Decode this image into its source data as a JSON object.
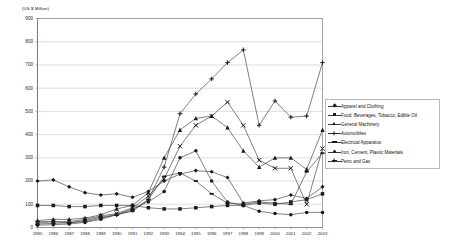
{
  "chart_data": {
    "type": "line",
    "title": "",
    "subtitle": "",
    "xlabel": "",
    "ylabel": "(US $ Million)",
    "ylim": [
      0,
      900
    ],
    "ytick_step": 100,
    "yticks": [
      "0",
      "100",
      "200",
      "300",
      "400",
      "500",
      "600",
      "700",
      "800",
      "900"
    ],
    "grid": true,
    "grid_axis": "y",
    "legend_position": "right-middle",
    "categories": [
      "1985",
      "1986",
      "1987",
      "1988",
      "1989",
      "1990",
      "1991",
      "1992",
      "1993",
      "1994",
      "1995",
      "1996",
      "1997",
      "1998",
      "1999",
      "2000",
      "2001",
      "2002",
      "2003"
    ],
    "x": [
      "1985",
      "1986",
      "1987",
      "1988",
      "1989",
      "1990",
      "1991",
      "1992",
      "1993",
      "1994",
      "1995",
      "1996",
      "1997",
      "1998",
      "1999",
      "2000",
      "2001",
      "2002",
      "2003"
    ],
    "series": [
      {
        "name": "Apparel and Clothing",
        "marker": "diamond",
        "values": [
          200,
          205,
          175,
          150,
          140,
          145,
          130,
          155,
          200,
          230,
          245,
          240,
          215,
          105,
          115,
          120,
          140,
          125,
          175
        ]
      },
      {
        "name": "Food, Beverages, Tobacco, Edible Oil",
        "marker": "square",
        "values": [
          95,
          95,
          90,
          90,
          95,
          95,
          95,
          85,
          80,
          80,
          85,
          90,
          95,
          95,
          105,
          100,
          110,
          120,
          145
        ]
      },
      {
        "name": "General Machinery",
        "marker": "triangle",
        "values": [
          30,
          35,
          35,
          40,
          55,
          80,
          95,
          150,
          300,
          420,
          470,
          480,
          430,
          330,
          260,
          300,
          300,
          250,
          420
        ]
      },
      {
        "name": "Automobiles",
        "marker": "cross",
        "values": [
          20,
          25,
          25,
          35,
          50,
          60,
          85,
          135,
          210,
          350,
          440,
          480,
          540,
          440,
          290,
          255,
          255,
          100,
          340
        ]
      },
      {
        "name": "Electrical Apparatus",
        "marker": "bar",
        "values": [
          15,
          18,
          20,
          30,
          45,
          55,
          70,
          120,
          220,
          235,
          200,
          145,
          105,
          100,
          110,
          105,
          100,
          240,
          320
        ]
      },
      {
        "name": "Iron, Cement, Plastic Materials",
        "marker": "circle",
        "values": [
          10,
          12,
          15,
          22,
          35,
          55,
          80,
          110,
          155,
          300,
          330,
          200,
          110,
          95,
          70,
          60,
          55,
          65,
          65
        ]
      },
      {
        "name": "Petro and Gas",
        "marker": "plus",
        "values": [
          25,
          25,
          20,
          25,
          40,
          55,
          75,
          120,
          260,
          490,
          575,
          640,
          710,
          765,
          440,
          545,
          475,
          480,
          710
        ]
      }
    ]
  },
  "legend": {
    "items": [
      {
        "label": "Apparel and Clothing",
        "marker": "diamond"
      },
      {
        "label": "Food, Beverages, Tobacco, Edible Oil",
        "marker": "square"
      },
      {
        "label": "General Machinery",
        "marker": "triangle"
      },
      {
        "label": "Automobiles",
        "marker": "cross"
      },
      {
        "label": "Electrical Apparatus",
        "marker": "bar"
      },
      {
        "label": "Iron, Cement, Plastic Materials",
        "marker": "circle"
      },
      {
        "label": "Petro and Gas",
        "marker": "plus"
      }
    ]
  },
  "colors": {
    "line": "#3a3a3a",
    "marker": "#1a1a1a",
    "grid": "#c8c8c8",
    "axis": "#8f8f8f",
    "background": "#ffffff",
    "legend_border": "#b9b9b9"
  }
}
